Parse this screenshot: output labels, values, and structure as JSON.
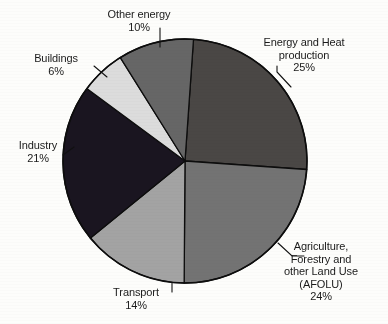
{
  "figure": {
    "background_color": "#fdfdfb",
    "outline_color": "#000000"
  },
  "chart_data": {
    "type": "pie",
    "title": "",
    "subtitle": "",
    "xlabel": "",
    "ylabel": "",
    "legend_position": "none",
    "grid": false,
    "unit": "%",
    "start_angle_deg": -86,
    "direction": "clockwise",
    "center": {
      "x": 185,
      "y": 161
    },
    "radius": 122,
    "categories": [
      "Energy and Heat production",
      "Agriculture, Forestry and other Land Use (AFOLU)",
      "Transport",
      "Industry",
      "Buildings",
      "Other energy"
    ],
    "values": [
      25,
      24,
      14,
      21,
      6,
      10
    ],
    "colors": [
      "#4a4745",
      "#737373",
      "#a3a3a3",
      "#1a1520",
      "#dcdcdc",
      "#666666"
    ],
    "slices": [
      {
        "key": "energy-heat",
        "label": "Energy and Heat production",
        "value": 25,
        "color": "#4a4745",
        "label_lines": [
          "Energy and Heat",
          "production",
          "25%"
        ],
        "percent_text": "25%"
      },
      {
        "key": "afolu",
        "label": "Agriculture, Forestry and other Land Use (AFOLU)",
        "value": 24,
        "color": "#737373",
        "label_lines": [
          "Agriculture,",
          "Forestry and",
          "other Land Use",
          "(AFOLU)",
          "24%"
        ],
        "percent_text": "24%"
      },
      {
        "key": "transport",
        "label": "Transport",
        "value": 14,
        "color": "#a3a3a3",
        "label_lines": [
          "Transport",
          "14%"
        ],
        "percent_text": "14%"
      },
      {
        "key": "industry",
        "label": "Industry",
        "value": 21,
        "color": "#1a1520",
        "label_lines": [
          "Industry",
          "21%"
        ],
        "percent_text": "21%"
      },
      {
        "key": "buildings",
        "label": "Buildings",
        "value": 6,
        "color": "#dcdcdc",
        "label_lines": [
          "Buildings",
          "6%"
        ],
        "percent_text": "6%"
      },
      {
        "key": "other-energy",
        "label": "Other energy",
        "value": 10,
        "color": "#666666",
        "label_lines": [
          "Other energy",
          "10%"
        ],
        "percent_text": "10%"
      }
    ]
  },
  "labels": {
    "energy_heat": "Energy and Heat\nproduction\n25%",
    "afolu": "Agriculture,\nForestry and\nother Land Use\n(AFOLU)\n24%",
    "transport": "Transport\n14%",
    "industry": "Industry\n21%",
    "buildings": "Buildings\n6%",
    "other_energy": "Other energy\n10%"
  }
}
